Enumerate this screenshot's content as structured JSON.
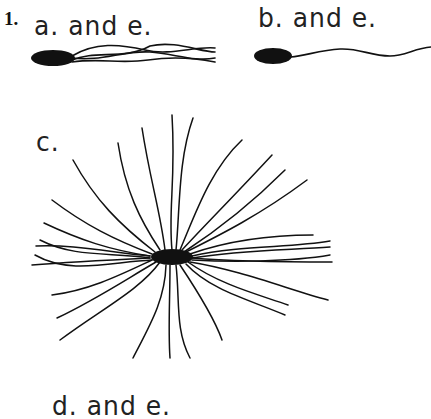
{
  "question_number": "1.",
  "panels": [
    {
      "id": "a",
      "label": "a. and e.",
      "description": "lophotrichous bacterium - rod with tuft of flagella at one pole"
    },
    {
      "id": "b",
      "label": "b. and e.",
      "description": "monotrichous bacterium - rod with single polar flagellum"
    },
    {
      "id": "c",
      "label": "c.",
      "description": "peritrichous bacterium - flagella all around the cell"
    },
    {
      "id": "d",
      "label": "d. and e.",
      "description": "partially visible label at bottom (cut off)"
    }
  ],
  "colors": {
    "ink": "#111111",
    "background": "#ffffff"
  }
}
